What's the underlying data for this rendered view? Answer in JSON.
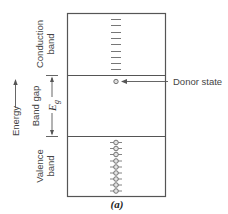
{
  "diagram": {
    "caption": "(a)",
    "axis": {
      "label": "Energy",
      "direction": "up"
    },
    "bands": [
      {
        "id": "conduction",
        "label_line1": "Conduction",
        "label_line2": "band",
        "states": "empty-levels",
        "count": 9
      },
      {
        "id": "band_gap",
        "label": "Band gap",
        "gap_symbol": "E",
        "gap_subscript": "g"
      },
      {
        "id": "valence",
        "label_line1": "Valence",
        "label_line2": "band",
        "states": "filled-electrons",
        "count": 9
      }
    ],
    "annotations": [
      {
        "label": "Donor state",
        "points_to": "donor-level",
        "position": "just below conduction band"
      }
    ],
    "colors": {
      "line": "#555555",
      "text": "#444444",
      "background": "#ffffff"
    }
  }
}
